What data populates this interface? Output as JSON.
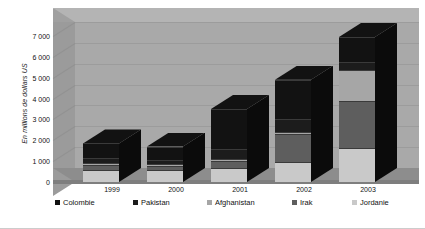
{
  "chart_data": {
    "type": "bar",
    "subtype": "stacked-column-3d",
    "title": "",
    "xlabel": "",
    "ylabel": "En millions de dollars US",
    "categories": [
      "1999",
      "2000",
      "2001",
      "2002",
      "2003"
    ],
    "ylim": [
      0,
      7000
    ],
    "yticks": [
      0,
      1000,
      2000,
      3000,
      4000,
      5000,
      6000,
      7000
    ],
    "ytick_labels": [
      "0",
      "1 000",
      "2 000",
      "3 000",
      "4 000",
      "5 000",
      "6 000",
      "7 000"
    ],
    "grid": true,
    "legend_position": "bottom",
    "stack_order_bottom_to_top": [
      "Jordanie",
      "Irak",
      "Afghanistan",
      "Pakistan",
      "Colombie"
    ],
    "series": [
      {
        "name": "Colombie",
        "color": "#121212",
        "values": [
          700,
          650,
          1900,
          1900,
          1200
        ]
      },
      {
        "name": "Pakistan",
        "color": "#1c1c1c",
        "values": [
          250,
          200,
          500,
          600,
          400
        ]
      },
      {
        "name": "Afghanistan",
        "color": "#a6a6a6",
        "values": [
          100,
          100,
          100,
          100,
          1450
        ]
      },
      {
        "name": "Irak",
        "color": "#5e5e5e",
        "values": [
          200,
          150,
          350,
          1350,
          2250
        ]
      },
      {
        "name": "Jordanie",
        "color": "#c9c9c9",
        "values": [
          600,
          600,
          650,
          950,
          1650
        ]
      }
    ],
    "totals": [
      1850,
      1700,
      3500,
      4900,
      6950
    ],
    "colors": {
      "plot_back_wall": "#a9a9a9",
      "plot_top": "#b4b4b4",
      "plot_floor": "#8d8d8d",
      "gridline": "#9c9c9c",
      "bar_side": "#0b0b0b",
      "bar_top": "#2b2b2b",
      "text": "#111111"
    }
  },
  "legend": {
    "items": [
      {
        "label": "Colombie",
        "color": "#121212"
      },
      {
        "label": "Pakistan",
        "color": "#1c1c1c"
      },
      {
        "label": "Afghanistan",
        "color": "#a6a6a6"
      },
      {
        "label": "Irak",
        "color": "#5e5e5e"
      },
      {
        "label": "Jordanie",
        "color": "#c9c9c9"
      }
    ]
  }
}
